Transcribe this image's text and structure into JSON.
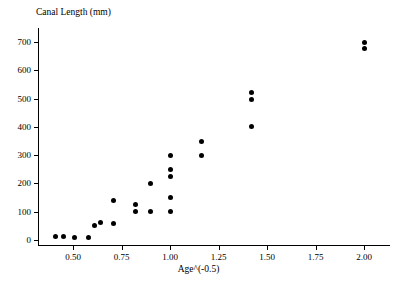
{
  "chart_data": {
    "type": "scatter",
    "title": "",
    "xlabel": "Age^(-0.5)",
    "ylabel": "Canal Length (mm)",
    "xlim": [
      0.33,
      2.13
    ],
    "ylim": [
      0,
      730
    ],
    "grid": false,
    "legend": null,
    "marker": {
      "shape": "circle",
      "color": "#000000",
      "size_px": 5
    },
    "x_ticks": [
      0.5,
      0.75,
      1.0,
      1.25,
      1.5,
      1.75,
      2.0
    ],
    "x_tick_labels": [
      "0.50",
      "0.75",
      "1.00",
      "1.25",
      "1.50",
      "1.75",
      "2.00"
    ],
    "y_ticks": [
      0,
      100,
      200,
      300,
      400,
      500,
      600,
      700
    ],
    "y_tick_labels": [
      "0",
      "100",
      "200",
      "300",
      "400",
      "500",
      "600",
      "700"
    ],
    "points": [
      {
        "x": 0.41,
        "y": 12
      },
      {
        "x": 0.45,
        "y": 12
      },
      {
        "x": 0.51,
        "y": 10
      },
      {
        "x": 0.58,
        "y": 10
      },
      {
        "x": 0.61,
        "y": 50
      },
      {
        "x": 0.64,
        "y": 62
      },
      {
        "x": 0.71,
        "y": 140
      },
      {
        "x": 0.71,
        "y": 60
      },
      {
        "x": 0.82,
        "y": 125
      },
      {
        "x": 0.82,
        "y": 100
      },
      {
        "x": 0.9,
        "y": 200
      },
      {
        "x": 0.9,
        "y": 100
      },
      {
        "x": 1.0,
        "y": 300
      },
      {
        "x": 1.0,
        "y": 250
      },
      {
        "x": 1.0,
        "y": 225
      },
      {
        "x": 1.0,
        "y": 150
      },
      {
        "x": 1.0,
        "y": 100
      },
      {
        "x": 1.16,
        "y": 350
      },
      {
        "x": 1.16,
        "y": 300
      },
      {
        "x": 1.42,
        "y": 520
      },
      {
        "x": 1.42,
        "y": 498
      },
      {
        "x": 1.42,
        "y": 400
      },
      {
        "x": 2.0,
        "y": 700
      },
      {
        "x": 2.0,
        "y": 678
      }
    ]
  }
}
